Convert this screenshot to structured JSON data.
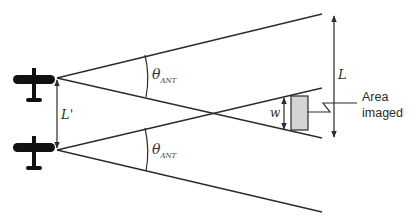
{
  "diagram": {
    "labels": {
      "baseline": "L'",
      "beam_angle_symbol": "θ",
      "beam_angle_subscript": "ANT",
      "swath": "L",
      "width": "w",
      "area_line1": "Area",
      "area_line2": "imaged"
    },
    "aircraft": [
      {
        "id": "aircraft-top",
        "icon": "airplane-icon"
      },
      {
        "id": "aircraft-bottom",
        "icon": "airplane-icon"
      }
    ],
    "colors": {
      "line": "#2b2b2b",
      "aircraft": "#111111",
      "area_fill": "#d4d4d4",
      "text": "#333333"
    }
  }
}
